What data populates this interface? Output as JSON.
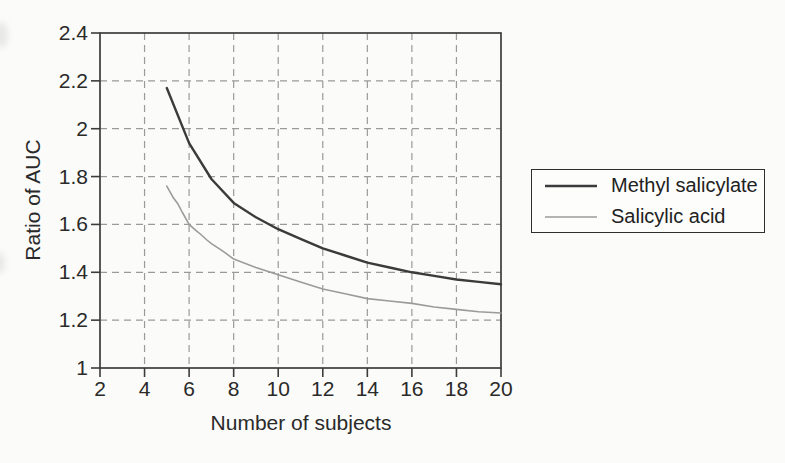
{
  "chart_data": {
    "type": "line",
    "title": "",
    "xlabel": "Number of subjects",
    "ylabel": "Ratio of AUC",
    "xlim": [
      2,
      20
    ],
    "ylim": [
      1,
      2.4
    ],
    "grid": "dashed",
    "legend_position": "outside-right",
    "xticks": [
      {
        "value": 2,
        "label": "2"
      },
      {
        "value": 4,
        "label": "4"
      },
      {
        "value": 6,
        "label": "6"
      },
      {
        "value": 8,
        "label": "8"
      },
      {
        "value": 10,
        "label": "10"
      },
      {
        "value": 12,
        "label": "12"
      },
      {
        "value": 14,
        "label": "14"
      },
      {
        "value": 16,
        "label": "16"
      },
      {
        "value": 18,
        "label": "18"
      },
      {
        "value": 20,
        "label": "20"
      }
    ],
    "yticks": [
      {
        "value": 1,
        "label": "1"
      },
      {
        "value": 1.2,
        "label": "1.2"
      },
      {
        "value": 1.4,
        "label": "1.4"
      },
      {
        "value": 1.6,
        "label": "1.6"
      },
      {
        "value": 1.8,
        "label": "1.8"
      },
      {
        "value": 2,
        "label": "2"
      },
      {
        "value": 2.2,
        "label": "2.2"
      },
      {
        "value": 2.4,
        "label": "2.4"
      }
    ],
    "series": [
      {
        "name": "Methyl salicylate",
        "color": "#3b3b3b",
        "stroke_width": 2.4,
        "x": [
          5,
          6,
          7,
          8,
          9,
          10,
          11,
          12,
          13,
          14,
          15,
          16,
          17,
          18,
          19,
          20
        ],
        "y": [
          2.17,
          1.94,
          1.79,
          1.69,
          1.63,
          1.58,
          1.54,
          1.5,
          1.47,
          1.44,
          1.42,
          1.4,
          1.385,
          1.37,
          1.36,
          1.35
        ]
      },
      {
        "name": "Salicylic acid",
        "color": "#9b9b9b",
        "stroke_width": 1.6,
        "x": [
          5,
          5.3,
          5.5,
          5.7,
          6,
          6.3,
          6.5,
          6.8,
          7,
          7.5,
          8,
          9,
          10,
          11,
          12,
          13,
          14,
          15,
          16,
          17,
          18,
          19,
          20
        ],
        "y": [
          1.76,
          1.71,
          1.685,
          1.65,
          1.6,
          1.575,
          1.56,
          1.535,
          1.52,
          1.49,
          1.455,
          1.42,
          1.39,
          1.36,
          1.33,
          1.31,
          1.29,
          1.28,
          1.27,
          1.255,
          1.245,
          1.235,
          1.23
        ]
      }
    ]
  }
}
